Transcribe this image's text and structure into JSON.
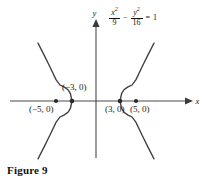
{
  "figure": {
    "caption": "Figure 9",
    "equation": {
      "term1_numerator": "x",
      "term1_numerator_exponent": "2",
      "term1_denominator": "9",
      "operator": "−",
      "term2_numerator": "y",
      "term2_numerator_exponent": "2",
      "term2_denominator": "16",
      "equals": "=",
      "right_side": "1",
      "plain_text": "x²/9 − y²/16 = 1"
    },
    "axes": {
      "x_label": "x",
      "y_label": "y"
    },
    "labels": {
      "focus_left": "(−5, 0)",
      "vertex_left": "(−3, 0)",
      "vertex_right": "(3, 0)",
      "focus_right": "(5, 0)"
    },
    "colors": {
      "background": "#ffffff",
      "axis": "#4a4a4a",
      "curve": "#3f3f3f",
      "dot": "#2b2b2b",
      "text": "#1a1a1a"
    }
  },
  "chart_data": {
    "type": "line",
    "title": "",
    "subtitle": "",
    "xlabel": "x",
    "ylabel": "y",
    "grid": false,
    "legend": "none",
    "conic": "hyperbola",
    "equation": "x^2/9 - y^2/16 = 1",
    "parameters": {
      "a": 3,
      "b": 4,
      "c": 5,
      "center": [
        0,
        0
      ],
      "transverse_axis": "horizontal",
      "asymptote_slopes": [
        1.3333,
        -1.3333
      ]
    },
    "xlim": [
      -10.75,
      11.75
    ],
    "ylim": [
      -7.25,
      10.1
    ],
    "annotations": [
      {
        "label": "(−5, 0)",
        "x": -5,
        "y": 0,
        "kind": "focus",
        "marker": "dot"
      },
      {
        "label": "(−3, 0)",
        "x": -3,
        "y": 0,
        "kind": "vertex",
        "marker": "dot"
      },
      {
        "label": "(3, 0)",
        "x": 3,
        "y": 0,
        "kind": "vertex",
        "marker": "dot"
      },
      {
        "label": "(5, 0)",
        "x": 5,
        "y": 0,
        "kind": "focus",
        "marker": "dot"
      }
    ],
    "series": [
      {
        "name": "left branch",
        "points": [
          [
            -7.25,
            -7.23
          ],
          [
            -6.5,
            -5.76
          ],
          [
            -5.75,
            -4.25
          ],
          [
            -5.0,
            -2.67
          ],
          [
            -4.5,
            -1.99
          ],
          [
            -4.0,
            -1.76
          ],
          [
            -3.5,
            -1.41
          ],
          [
            -3.2,
            -0.93
          ],
          [
            -3.0,
            0.0
          ],
          [
            -3.2,
            0.93
          ],
          [
            -3.5,
            1.41
          ],
          [
            -4.0,
            1.76
          ],
          [
            -4.5,
            1.99
          ],
          [
            -5.0,
            2.67
          ],
          [
            -5.75,
            4.25
          ],
          [
            -6.5,
            5.76
          ],
          [
            -7.25,
            7.23
          ]
        ]
      },
      {
        "name": "right branch",
        "points": [
          [
            7.25,
            -7.23
          ],
          [
            6.5,
            -5.76
          ],
          [
            5.75,
            -4.25
          ],
          [
            5.0,
            -2.67
          ],
          [
            4.5,
            -1.99
          ],
          [
            4.0,
            -1.76
          ],
          [
            3.5,
            -1.41
          ],
          [
            3.2,
            -0.93
          ],
          [
            3.0,
            0.0
          ],
          [
            3.2,
            0.93
          ],
          [
            3.5,
            1.41
          ],
          [
            4.0,
            1.76
          ],
          [
            4.5,
            1.99
          ],
          [
            5.0,
            2.67
          ],
          [
            5.75,
            4.25
          ],
          [
            6.5,
            5.76
          ],
          [
            7.25,
            7.23
          ]
        ]
      }
    ]
  }
}
